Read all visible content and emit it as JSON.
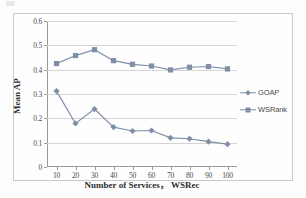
{
  "figure": {
    "background_color": "#fdfdfd",
    "frame_border_color": "#c9c9c9",
    "axis_color": "#9a9a9a",
    "grid_color": "#d5d5d5",
    "series_color": "#7e8fa6"
  },
  "chart_data": {
    "type": "line",
    "title": "",
    "xlabel": "Number of Services， WSRec",
    "ylabel": "Mean AP",
    "categories": [
      10,
      20,
      30,
      40,
      50,
      60,
      70,
      80,
      90,
      100
    ],
    "x_tick_labels": [
      "10",
      "20",
      "30",
      "40",
      "50",
      "60",
      "70",
      "80",
      "90",
      "100"
    ],
    "y_tick_labels": [
      "0.6",
      "0.5",
      "0.4",
      "0.3",
      "0.2",
      "0.1",
      "0"
    ],
    "y_tick_values": [
      0.6,
      0.5,
      0.4,
      0.3,
      0.2,
      0.1,
      0
    ],
    "xlim": [
      5,
      105
    ],
    "ylim": [
      0,
      0.6
    ],
    "grid": "horizontal",
    "legend_position": "right",
    "series": [
      {
        "name": "GOAP",
        "marker": "diamond",
        "color": "#7e8fa6",
        "values": [
          0.312,
          0.179,
          0.238,
          0.164,
          0.148,
          0.15,
          0.12,
          0.116,
          0.104,
          0.094
        ]
      },
      {
        "name": "WSRank",
        "marker": "square",
        "color": "#7e8fa6",
        "values": [
          0.425,
          0.458,
          0.482,
          0.437,
          0.422,
          0.415,
          0.399,
          0.41,
          0.413,
          0.403
        ]
      }
    ]
  }
}
